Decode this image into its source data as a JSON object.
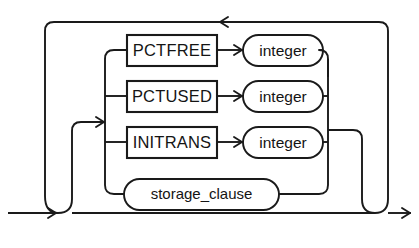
{
  "diagram": {
    "type": "railroad-syntax-diagram",
    "name": "physical_attributes_clause",
    "stroke_color": "#1a1a1a",
    "background_color": "#ffffff",
    "branches": [
      {
        "id": "pctfree",
        "keyword": "PCTFREE",
        "keyword_shape": "rectangle",
        "argument": "integer",
        "argument_shape": "stadium"
      },
      {
        "id": "pctused",
        "keyword": "PCTUSED",
        "keyword_shape": "rectangle",
        "argument": "integer",
        "argument_shape": "stadium"
      },
      {
        "id": "initrans",
        "keyword": "INITRANS",
        "keyword_shape": "rectangle",
        "argument": "integer",
        "argument_shape": "stadium"
      },
      {
        "id": "storage-clause",
        "keyword": "storage_clause",
        "keyword_shape": "stadium",
        "argument": null,
        "argument_shape": null
      }
    ],
    "arrows": [
      {
        "id": "entry-arrow",
        "direction": "right"
      },
      {
        "id": "branch-entry-arrow",
        "direction": "right"
      },
      {
        "id": "loopback-arrow",
        "direction": "left"
      },
      {
        "id": "pctfree-arg-arrow",
        "direction": "right"
      },
      {
        "id": "pctused-arg-arrow",
        "direction": "right"
      },
      {
        "id": "initrans-arg-arrow",
        "direction": "right"
      },
      {
        "id": "exit-arrow",
        "direction": "right"
      }
    ]
  }
}
